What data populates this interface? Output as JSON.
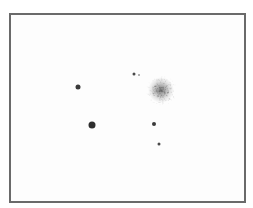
{
  "image": {
    "subject": "star field with globular cluster",
    "background_color": "#ffffff",
    "border_color": "#6a6a6a"
  },
  "stars": [
    {
      "x": 78,
      "y": 87,
      "r": 2.5,
      "color": "#3a3a3a"
    },
    {
      "x": 92,
      "y": 125,
      "r": 3.5,
      "color": "#2e2e2e"
    },
    {
      "x": 134,
      "y": 74,
      "r": 1.5,
      "color": "#4a4a4a"
    },
    {
      "x": 139,
      "y": 75,
      "r": 1,
      "color": "#9a9a9a"
    },
    {
      "x": 154,
      "y": 124,
      "r": 2,
      "color": "#3a3a3a"
    },
    {
      "x": 159,
      "y": 144,
      "r": 1.5,
      "color": "#4a4a4a"
    }
  ],
  "cluster": {
    "x": 161,
    "y": 90,
    "radius": 13,
    "color": "#555555"
  }
}
